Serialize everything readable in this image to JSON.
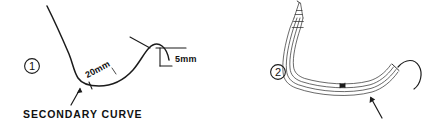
{
  "figure": {
    "title_visible": false,
    "background_color": "#ffffff",
    "ink_color": "#1b1b1b",
    "width": 433,
    "height": 128
  },
  "panels": [
    {
      "id": "panel-1",
      "number_label": "1",
      "number_style": "circled",
      "annotations": [
        {
          "id": "dim-20mm",
          "text": "20mm",
          "rotated": true,
          "rotation_deg": -28
        },
        {
          "id": "dim-5mm",
          "text": "5mm",
          "rotated": false
        },
        {
          "id": "caption-secondary-curve",
          "text": "SECONDARY CURVE",
          "rotated": false
        }
      ],
      "pointers": [
        {
          "id": "arrow-secondary-curve",
          "points_to": "curve-low-point",
          "direction": "up-right"
        }
      ]
    },
    {
      "id": "panel-2",
      "number_label": "2",
      "number_style": "circled",
      "annotations": [],
      "pointers": [
        {
          "id": "arrow-distal-tip",
          "points_to": "distal-hook",
          "direction": "up-left"
        }
      ]
    }
  ],
  "icons": {
    "circle_one": "circled-number-one",
    "circle_two": "circled-number-two",
    "arrow_up": "arrow-pointer-icon"
  }
}
